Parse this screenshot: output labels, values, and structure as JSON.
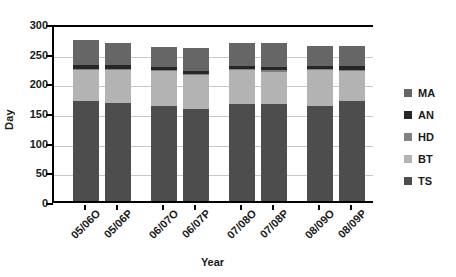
{
  "chart_data": {
    "type": "bar",
    "stacked": true,
    "title": "",
    "xlabel": "Year",
    "ylabel": "Day",
    "ylim": [
      0,
      300
    ],
    "ytick_step": 50,
    "yticks": [
      300,
      250,
      200,
      150,
      100,
      50,
      0
    ],
    "grid": true,
    "legend_position": "right",
    "categories": [
      "05/06O",
      "05/06P",
      "06/07O",
      "06/07P",
      "07/08O",
      "07/08P",
      "08/09O",
      "08/09P"
    ],
    "series": [
      {
        "name": "TS",
        "color": "#4d4d4d",
        "values": [
          168,
          166,
          160,
          155,
          163,
          164,
          160,
          168
        ]
      },
      {
        "name": "BT",
        "color": "#b3b3b3",
        "values": [
          53,
          55,
          59,
          57,
          57,
          54,
          60,
          51
        ]
      },
      {
        "name": "HD",
        "color": "#808080",
        "values": [
          2,
          2,
          2,
          2,
          2,
          2,
          2,
          2
        ]
      },
      {
        "name": "AN",
        "color": "#262626",
        "values": [
          6,
          6,
          5,
          5,
          6,
          6,
          6,
          6
        ]
      },
      {
        "name": "MA",
        "color": "#666666",
        "values": [
          42,
          38,
          34,
          39,
          39,
          41,
          33,
          35
        ]
      }
    ],
    "totals": [
      271,
      267,
      260,
      258,
      267,
      267,
      261,
      262
    ]
  },
  "legend": {
    "items": [
      {
        "label": "MA",
        "color": "#666666"
      },
      {
        "label": "AN",
        "color": "#262626"
      },
      {
        "label": "HD",
        "color": "#808080"
      },
      {
        "label": "BT",
        "color": "#b3b3b3"
      },
      {
        "label": "TS",
        "color": "#4d4d4d"
      }
    ]
  },
  "axes": {
    "y_title": "Day",
    "x_title": "Year"
  }
}
